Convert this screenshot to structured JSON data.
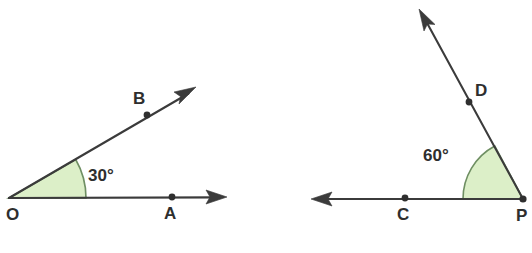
{
  "figure": {
    "background_color": "#ffffff",
    "line_color": "#3b3b3b",
    "label_color": "#2e2e2e",
    "wedge_fill_color": "#dcefc8",
    "wedge_stroke_color": "#6f8f63",
    "diagrams": [
      {
        "id": "angle-aob",
        "vertex": {
          "name": "O",
          "label": "O",
          "x": 9,
          "y": 198,
          "label_x": 6,
          "label_y": 220
        },
        "angle": {
          "value": 30,
          "label": "30°",
          "label_x": 88,
          "label_y": 181
        },
        "rays": [
          {
            "name": "ray-oa",
            "point": {
              "name": "A",
              "label": "A",
              "dot_x": 172,
              "dot_y": 197,
              "label_x": 164,
              "label_y": 219
            },
            "tip_x": 227,
            "tip_y": 197,
            "direction_deg": 0
          },
          {
            "name": "ray-ob",
            "point": {
              "name": "B",
              "label": "B",
              "dot_x": 147,
              "dot_y": 115,
              "label_x": 133,
              "label_y": 104
            },
            "tip_x": 196,
            "tip_y": 87,
            "direction_deg": 30
          }
        ]
      },
      {
        "id": "angle-dpc",
        "vertex": {
          "name": "P",
          "label": "P",
          "x": 523,
          "y": 199,
          "label_x": 516,
          "label_y": 221
        },
        "angle": {
          "value": 60,
          "label": "60°",
          "label_x": 423,
          "label_y": 161
        },
        "rays": [
          {
            "name": "ray-pc",
            "point": {
              "name": "C",
              "label": "C",
              "dot_x": 405,
              "dot_y": 198,
              "label_x": 397,
              "label_y": 220
            },
            "tip_x": 311,
            "tip_y": 199,
            "direction_deg": 180
          },
          {
            "name": "ray-pd",
            "point": {
              "name": "D",
              "label": "D",
              "dot_x": 469,
              "dot_y": 102,
              "label_x": 475,
              "label_y": 96
            },
            "tip_x": 419,
            "tip_y": 9,
            "direction_deg": 118
          }
        ]
      }
    ]
  }
}
